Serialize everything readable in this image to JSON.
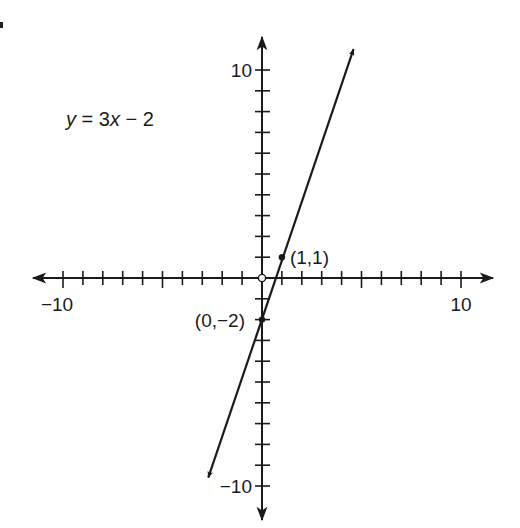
{
  "chart_data": {
    "type": "line",
    "title": "",
    "equation": {
      "y": "y",
      "eq": " = 3",
      "x": "x",
      "rest": " − 2"
    },
    "equation_text": "y = 3x − 2",
    "slope": 3,
    "intercept": -2,
    "xlabel": "",
    "ylabel": "",
    "xlim": [
      -10,
      10
    ],
    "ylim": [
      -10,
      10
    ],
    "tick_step": 1,
    "x_tick_labels": [
      {
        "value": -10,
        "text": "−10"
      },
      {
        "value": 10,
        "text": "10"
      }
    ],
    "y_tick_labels": [
      {
        "value": 10,
        "text": "10"
      },
      {
        "value": -10,
        "text": "−10"
      }
    ],
    "line_endpoints": [
      {
        "x": -2.7,
        "y": -9.6
      },
      {
        "x": 4.6,
        "y": 11.0
      }
    ],
    "points": [
      {
        "x": 1,
        "y": 1,
        "label": "(1,1)",
        "filled": true
      },
      {
        "x": 0,
        "y": -2,
        "label": "(0,−2)",
        "filled": true
      },
      {
        "x": 0,
        "y": 0,
        "label": "",
        "filled": false
      }
    ],
    "grid": false,
    "legend": "none"
  },
  "colors": {
    "ink": "#1a1a1a",
    "background": "#ffffff"
  }
}
